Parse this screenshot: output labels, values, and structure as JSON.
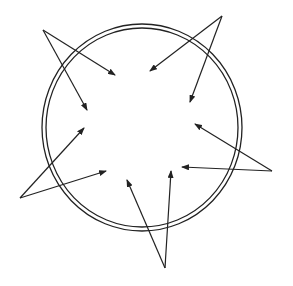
{
  "diagram": {
    "stroke_color": "#222222",
    "background": "#ffffff",
    "rings": {
      "center": [
        142,
        127.5
      ],
      "outer": {
        "rx": 100,
        "ry": 103.5
      },
      "inner": {
        "rx": 96,
        "ry": 99.5
      }
    },
    "arrow_groups": [
      {
        "name": "top-left",
        "apex": [
          43,
          30
        ],
        "tips": [
          [
            115,
            75
          ],
          [
            87,
            110
          ]
        ]
      },
      {
        "name": "top-right",
        "apex": [
          222,
          16
        ],
        "tips": [
          [
            150,
            71
          ],
          [
            190,
            102
          ]
        ]
      },
      {
        "name": "right",
        "apex": [
          272,
          171
        ],
        "tips": [
          [
            195,
            124
          ],
          [
            182,
            167
          ]
        ]
      },
      {
        "name": "bottom",
        "apex": [
          165,
          268
        ],
        "tips": [
          [
            127,
            180
          ],
          [
            171,
            171
          ]
        ]
      },
      {
        "name": "left",
        "apex": [
          20,
          198
        ],
        "tips": [
          [
            84,
            128
          ],
          [
            106,
            171
          ]
        ]
      }
    ]
  }
}
